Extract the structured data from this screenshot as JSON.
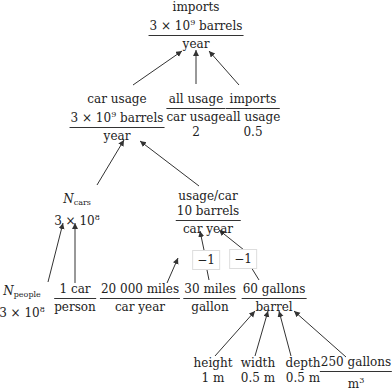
{
  "diagram": {
    "root": {
      "label": "imports",
      "numerator": "3 × 10",
      "numerator_exp": "9",
      "numerator_unit": " barrels",
      "denominator": "year"
    },
    "level1": {
      "car_usage": {
        "label": "car usage",
        "numerator": "3 × 10",
        "numerator_exp": "9",
        "numerator_unit": " barrels",
        "denominator": "year"
      },
      "all_usage_ratio": {
        "numerator": "all usage",
        "denominator": "car usage",
        "value": "2"
      },
      "imports_ratio": {
        "numerator": "imports",
        "denominator": "all usage",
        "value": "0.5"
      }
    },
    "level2": {
      "n_cars": {
        "symbol": "N",
        "subscript": "cars",
        "value_base": "3 × 10",
        "value_exp": "8"
      },
      "usage_per_car": {
        "label": "usage/car",
        "numerator": "10 barrels",
        "denominator": "car year"
      }
    },
    "level3": {
      "n_people": {
        "symbol": "N",
        "subscript": "people",
        "value_base": "3 × 10",
        "value_exp": "8"
      },
      "cars_per_person": {
        "numerator": "1 car",
        "denominator": "person"
      },
      "miles_per_car_year": {
        "numerator": "20 000 miles",
        "denominator": "car year"
      },
      "miles_per_gallon": {
        "numerator": "30 miles",
        "denominator": "gallon",
        "exponent_tag": "−1"
      },
      "gallons_per_barrel": {
        "numerator": "60 gallons",
        "denominator": "barrel",
        "exponent_tag": "−1"
      }
    },
    "level4": {
      "height": {
        "label": "height",
        "value": "1 m"
      },
      "width": {
        "label": "width",
        "value": "0.5 m"
      },
      "depth": {
        "label": "depth",
        "value": "0.5 m"
      },
      "gallons_per_m3": {
        "numerator": "250 gallons",
        "denominator_base": "m",
        "denominator_exp": "3"
      }
    }
  }
}
